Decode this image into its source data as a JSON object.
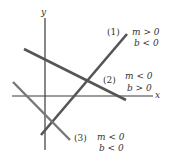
{
  "axes": {
    "x_label": "x",
    "y_label": "y",
    "color": "#3a3a3a"
  },
  "lines": [
    {
      "id": "1",
      "label": "(1)",
      "slope": "m > 0",
      "intercept": "b < 0",
      "color": "#555555"
    },
    {
      "id": "2",
      "label": "(2)",
      "slope": "m < 0",
      "intercept": "b > 0",
      "color": "#555555"
    },
    {
      "id": "3",
      "label": "(3)",
      "slope": "m < 0",
      "intercept": "b < 0",
      "color": "#777777"
    }
  ]
}
